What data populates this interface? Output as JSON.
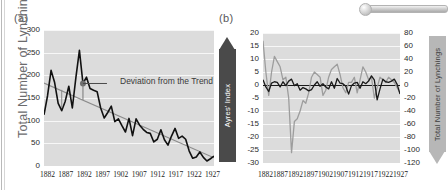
{
  "figure": {
    "panel_a_label": "(a)",
    "panel_b_label": "(b)"
  },
  "chart_data": [
    {
      "id": "panel-a",
      "type": "line",
      "title": "(a)",
      "xlabel": "",
      "ylabel": "Total Number of Lynchings",
      "ylim": [
        0,
        300
      ],
      "yticks": [
        0,
        50,
        100,
        150,
        200,
        250,
        300
      ],
      "xlim": [
        1882,
        1930
      ],
      "xticks": [
        1882,
        1887,
        1892,
        1897,
        1902,
        1907,
        1912,
        1917,
        1922,
        1927
      ],
      "grid": true,
      "legend": "none",
      "annotations": [
        {
          "text": "Deviation from the Trend",
          "x": 1895,
          "y": 178
        }
      ],
      "series": [
        {
          "name": "Total Number of Lynchings",
          "color": "#111111",
          "x": [
            1882,
            1883,
            1884,
            1885,
            1886,
            1887,
            1888,
            1889,
            1890,
            1891,
            1892,
            1893,
            1894,
            1895,
            1896,
            1897,
            1898,
            1899,
            1900,
            1901,
            1902,
            1903,
            1904,
            1905,
            1906,
            1907,
            1908,
            1909,
            1910,
            1911,
            1912,
            1913,
            1914,
            1915,
            1916,
            1917,
            1918,
            1919,
            1920,
            1921,
            1922,
            1923,
            1924,
            1925,
            1926,
            1927,
            1928,
            1929,
            1930
          ],
          "values": [
            113,
            155,
            211,
            184,
            138,
            122,
            143,
            176,
            128,
            195,
            255,
            182,
            196,
            171,
            167,
            164,
            128,
            106,
            118,
            132,
            98,
            104,
            89,
            75,
            105,
            67,
            104,
            90,
            81,
            74,
            72,
            53,
            59,
            80,
            58,
            46,
            66,
            83,
            61,
            66,
            59,
            33,
            17,
            20,
            31,
            19,
            11,
            16,
            22
          ]
        },
        {
          "name": "Linear Trend",
          "color": "#8b8b8b",
          "x": [
            1882,
            1930
          ],
          "values": [
            183,
            18
          ]
        }
      ]
    },
    {
      "id": "panel-b",
      "type": "line",
      "title": "(b)",
      "xlabel": "",
      "ylabel_left": "Ayres' Index",
      "ylabel_right": "Total Number of Lynchings",
      "ylim_left": [
        -30,
        20
      ],
      "yticks_left": [
        20,
        15,
        10,
        5,
        0,
        -5,
        -10,
        -15,
        -20,
        -25,
        -30
      ],
      "ylim_right": [
        -120,
        80
      ],
      "yticks_right": [
        80,
        60,
        40,
        20,
        0,
        -20,
        -40,
        -60,
        -80,
        -100,
        -120
      ],
      "xlim": [
        1882,
        1930
      ],
      "xticks": [
        1882,
        1887,
        1892,
        1897,
        1902,
        1907,
        1912,
        1917,
        1922,
        1927
      ],
      "grid": true,
      "zeroline": true,
      "legend": "none",
      "series": [
        {
          "name": "Ayres' Index",
          "axis": "left",
          "color": "#9d9d9d",
          "x": [
            1882,
            1883,
            1884,
            1885,
            1886,
            1887,
            1888,
            1889,
            1890,
            1891,
            1892,
            1893,
            1894,
            1895,
            1896,
            1897,
            1898,
            1899,
            1900,
            1901,
            1902,
            1903,
            1904,
            1905,
            1906,
            1907,
            1908,
            1909,
            1910,
            1911,
            1912,
            1913,
            1914,
            1915,
            1916,
            1917,
            1918,
            1919,
            1920,
            1921,
            1922,
            1923,
            1924,
            1925,
            1926,
            1927,
            1928,
            1929,
            1930
          ],
          "values": [
            17,
            5,
            -4,
            5,
            11,
            9,
            7,
            2,
            3,
            -5,
            -26,
            -14,
            -13,
            -10,
            -6,
            -7,
            -3,
            3,
            5,
            4,
            3,
            -4,
            -2,
            3,
            6,
            7,
            8,
            4,
            -1,
            -3,
            1,
            1,
            3,
            -3,
            2,
            7,
            5,
            2,
            3,
            -5,
            -1,
            3,
            2,
            1,
            3,
            2,
            1,
            -1,
            -3
          ]
        },
        {
          "name": "Total Number of Lynchings (detrended)",
          "axis": "right",
          "color": "#1a1a1a",
          "x": [
            1882,
            1883,
            1884,
            1885,
            1886,
            1887,
            1888,
            1889,
            1890,
            1891,
            1892,
            1893,
            1894,
            1895,
            1896,
            1897,
            1898,
            1899,
            1900,
            1901,
            1902,
            1903,
            1904,
            1905,
            1906,
            1907,
            1908,
            1909,
            1910,
            1911,
            1912,
            1913,
            1914,
            1915,
            1916,
            1917,
            1918,
            1919,
            1920,
            1921,
            1922,
            1923,
            1924,
            1925,
            1926,
            1927,
            1928,
            1929,
            1930
          ],
          "values": [
            8,
            -3,
            -10,
            3,
            5,
            4,
            -3,
            5,
            -1,
            6,
            9,
            -1,
            2,
            -8,
            -4,
            -6,
            -9,
            -7,
            0,
            5,
            -2,
            2,
            -3,
            -6,
            5,
            -5,
            10,
            3,
            2,
            -2,
            -14,
            -1,
            3,
            4,
            -5,
            5,
            2,
            6,
            14,
            8,
            -23,
            -6,
            9,
            5,
            4,
            6,
            9,
            1,
            -14
          ]
        }
      ]
    }
  ]
}
